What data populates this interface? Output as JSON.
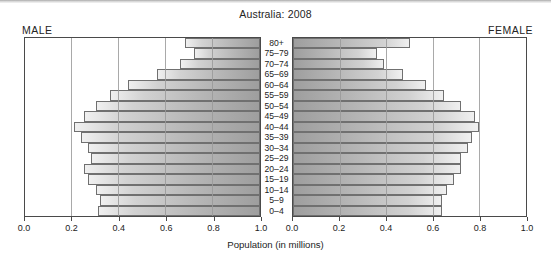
{
  "chart_data": {
    "type": "bar",
    "subtype": "population-pyramid",
    "title": "Australia: 2008",
    "xlabel": "Population (in millions)",
    "ylabel": "",
    "categories": [
      "80+",
      "75–79",
      "70–74",
      "65–69",
      "60–64",
      "55–59",
      "50–54",
      "45–49",
      "40–44",
      "35–39",
      "30–34",
      "25–29",
      "20–24",
      "15–19",
      "10–14",
      "5–9",
      "0–4"
    ],
    "series": [
      {
        "name": "MALE",
        "side": "left",
        "values": [
          0.32,
          0.28,
          0.34,
          0.44,
          0.56,
          0.64,
          0.7,
          0.75,
          0.79,
          0.76,
          0.73,
          0.72,
          0.75,
          0.73,
          0.7,
          0.68,
          0.69
        ]
      },
      {
        "name": "FEMALE",
        "side": "right",
        "values": [
          0.5,
          0.36,
          0.39,
          0.47,
          0.57,
          0.65,
          0.72,
          0.78,
          0.8,
          0.77,
          0.75,
          0.72,
          0.72,
          0.69,
          0.66,
          0.64,
          0.64
        ]
      }
    ],
    "xlim_left": [
      1.0,
      0.0
    ],
    "xlim_right": [
      0.0,
      1.0
    ],
    "xticks_left": [
      "1.0",
      "0.8",
      "0.6",
      "0.4",
      "0.2",
      "0.0"
    ],
    "xticks_right": [
      "0.0",
      "0.2",
      "0.4",
      "0.6",
      "0.8",
      "1.0"
    ],
    "xtick_values": [
      0.0,
      0.2,
      0.4,
      0.6,
      0.8,
      1.0
    ],
    "grid": true,
    "grid_axis": "x",
    "legend": "none",
    "bar_color_dark": "#9e9e9e",
    "bar_color_light": "#f0f0f0",
    "bar_border_color": "#707070",
    "axis_color": "#4a4a4a"
  },
  "header": {
    "title": "Australia: 2008",
    "male_label": "MALE",
    "female_label": "FEMALE"
  },
  "axis": {
    "title": "Population (in millions)"
  }
}
